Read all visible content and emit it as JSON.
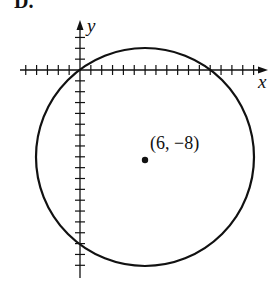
{
  "figure": {
    "option_label": "D.",
    "axis_x_label": "x",
    "axis_y_label": "y",
    "center_label": "(6, −8)",
    "center": [
      6,
      -8
    ],
    "radius": 10,
    "tick_spacing_units": 1,
    "x_ticks_range": [
      -5,
      16
    ],
    "y_ticks_range": [
      -18,
      3
    ],
    "colors": {
      "ink": "#111111",
      "background": "#ffffff"
    }
  }
}
